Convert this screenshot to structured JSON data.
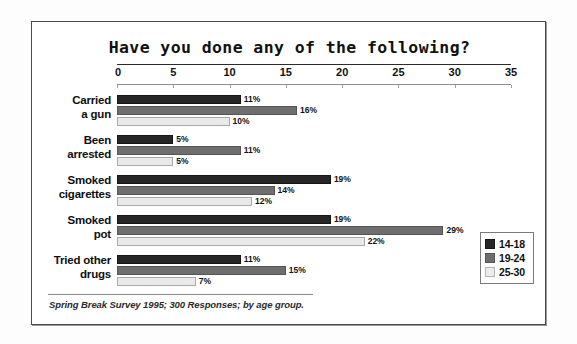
{
  "chart_data": {
    "type": "bar",
    "orientation": "horizontal",
    "title": "Have you done any of the following?",
    "xlabel": "",
    "ylabel": "",
    "xlim": [
      0,
      35
    ],
    "xticks": [
      0,
      5,
      10,
      15,
      20,
      25,
      30,
      35
    ],
    "grid": false,
    "legend_position": "bottom-right",
    "categories": [
      "Carried a gun",
      "Been arrested",
      "Smoked cigarettes",
      "Smoked pot",
      "Tried other drugs"
    ],
    "category_lines": [
      [
        "Carried",
        "a gun"
      ],
      [
        "Been",
        "arrested"
      ],
      [
        "Smoked",
        "cigarettes"
      ],
      [
        "Smoked",
        "pot"
      ],
      [
        "Tried other",
        "drugs"
      ]
    ],
    "series": [
      {
        "name": "14-18",
        "color": "#262626",
        "values": [
          11,
          5,
          19,
          19,
          11
        ],
        "labels": [
          "11%",
          "5%",
          "19%",
          "19%",
          "11%"
        ]
      },
      {
        "name": "19-24",
        "color": "#6e6e6e",
        "values": [
          16,
          11,
          14,
          29,
          15
        ],
        "labels": [
          "16%",
          "11%",
          "14%",
          "29%",
          "15%"
        ]
      },
      {
        "name": "25-30",
        "color": "#e9e9e9",
        "values": [
          10,
          5,
          12,
          22,
          7
        ],
        "labels": [
          "10%",
          "5%",
          "12%",
          "22%",
          "7%"
        ]
      }
    ],
    "footnote": "Spring Break Survey 1995; 300 Responses; by age group."
  },
  "legend": {
    "items": [
      {
        "label": "14-18",
        "color": "#262626"
      },
      {
        "label": "19-24",
        "color": "#6e6e6e"
      },
      {
        "label": "25-30",
        "color": "#e9e9e9"
      }
    ]
  },
  "ticks": {
    "labels": [
      "0",
      "5",
      "10",
      "15",
      "20",
      "25",
      "30",
      "35"
    ]
  }
}
